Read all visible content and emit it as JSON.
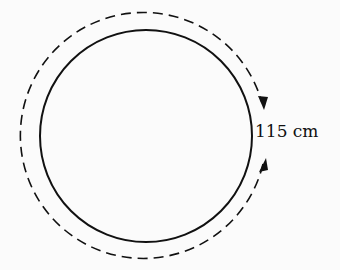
{
  "diagram": {
    "type": "circle-circumference",
    "label": "115 cm",
    "colors": {
      "stroke": "#111111",
      "background": "#fbfbfb"
    }
  }
}
